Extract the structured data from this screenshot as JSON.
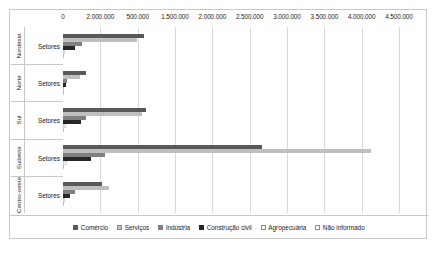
{
  "chart_data": {
    "type": "bar",
    "orientation": "horizontal",
    "title": "",
    "xlabel": "",
    "ylabel": "",
    "grid": true,
    "legend_position": "bottom",
    "categories": [
      "Nordeste",
      "Norte",
      "Sul",
      "Sudeste",
      "Centro-oeste"
    ],
    "category_sublabel": "Setores",
    "xlim": [
      0,
      4500000
    ],
    "axis_tick_labels": [
      "0",
      "2.000.000",
      "500.000",
      "1.500.000",
      "2.000.000",
      "2.500.000",
      "3.000.000",
      "3.500.000",
      "4.000.000",
      "4.500.000"
    ],
    "axis_tick_values": [
      0,
      500000,
      1000000,
      1500000,
      2000000,
      2500000,
      3000000,
      3500000,
      4000000,
      4500000
    ],
    "series": [
      {
        "name": "Comércio",
        "color": "#595959",
        "values": [
          1085000,
          306000,
          1115000,
          2665000,
          520000
        ]
      },
      {
        "name": "Serviços",
        "color": "#bfbfbf",
        "values": [
          985000,
          230000,
          1060000,
          4120000,
          620000
        ]
      },
      {
        "name": "Indústria",
        "color": "#808080",
        "values": [
          260000,
          52000,
          310000,
          560000,
          160000
        ]
      },
      {
        "name": "Construção civil",
        "color": "#262626",
        "values": [
          165000,
          40000,
          245000,
          370000,
          95000
        ]
      },
      {
        "name": "Agropecuária",
        "color": "#f2f2f2",
        "values": [
          30000,
          12000,
          40000,
          55000,
          30000
        ]
      },
      {
        "name": "Não informado",
        "color": "#fafafa",
        "values": [
          10000,
          5000,
          12000,
          18000,
          8000
        ]
      }
    ]
  },
  "legend": {
    "items": [
      {
        "label": "Comércio",
        "color": "#595959",
        "border": "#595959"
      },
      {
        "label": "Serviços",
        "color": "#bfbfbf",
        "border": "#8c8c8c"
      },
      {
        "label": "Indústria",
        "color": "#808080",
        "border": "#808080"
      },
      {
        "label": "Construção civil",
        "color": "#262626",
        "border": "#262626"
      },
      {
        "label": "Agropecuária",
        "color": "#ffffff",
        "border": "#8c8c8c"
      },
      {
        "label": "Não informado",
        "color": "#ffffff",
        "border": "#8c8c8c"
      }
    ]
  }
}
